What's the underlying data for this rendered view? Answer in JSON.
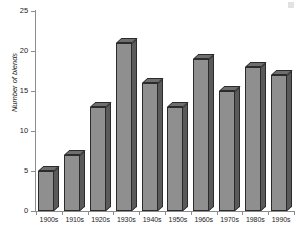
{
  "chart_data": {
    "type": "bar",
    "title": "",
    "xlabel": "",
    "ylabel": "Number of blends",
    "categories": [
      "1900s",
      "1910s",
      "1920s",
      "1930s",
      "1940s",
      "1950s",
      "1960s",
      "1970s",
      "1980s",
      "1990s"
    ],
    "values": [
      5,
      7,
      13,
      21,
      16,
      13,
      19,
      15,
      18,
      17
    ],
    "ylim": [
      0,
      25
    ],
    "yticks": [
      0,
      5,
      10,
      15,
      20,
      25
    ],
    "ytick_labels": [
      "0",
      "5",
      "10",
      "15",
      "20",
      "25"
    ],
    "grid": false,
    "legend": null,
    "style": "3d-bar",
    "bar_face_color": "#8f8f8f",
    "bar_side_color": "#5a5a5a",
    "bar_top_color": "#6e6e6e",
    "bar_edge_color": "#2b2b2b",
    "axis_color": "#8c8c8c",
    "background_color": "#ffffff"
  }
}
